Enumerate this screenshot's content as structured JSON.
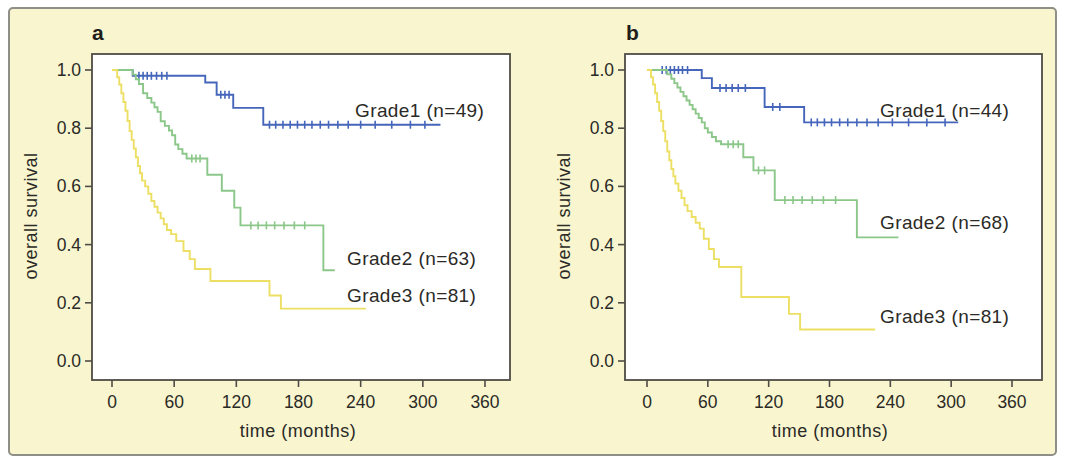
{
  "colors": {
    "grade1": "#4566ba",
    "grade2": "#8bc789",
    "grade3": "#ecdf63",
    "axis": "#4e4c46",
    "text": "#2b2a26",
    "figure_bg": "#f8f5cf",
    "figure_border": "#908f87"
  },
  "chart_data": [
    {
      "type": "line",
      "panel_label": "a",
      "xlabel": "time (months)",
      "ylabel": "overall survival",
      "xlim": [
        0,
        360
      ],
      "ylim": [
        0.0,
        1.0
      ],
      "xticks": [
        "0",
        "60",
        "120",
        "180",
        "240",
        "300",
        "360"
      ],
      "ytick_values": [
        1.0,
        0.8,
        0.6,
        0.4,
        0.2,
        0.0
      ],
      "ytick_labels": [
        "1.0",
        "0.8",
        "0.6",
        "0.4",
        "0.2",
        "0.0"
      ],
      "series": [
        {
          "name": "Grade1",
          "n": 49,
          "label": "Grade1 (n=49)",
          "color": "#4566ba",
          "drops": [
            [
              20,
              0.98
            ],
            [
              90,
              0.957
            ],
            [
              101,
              0.915
            ],
            [
              117,
              0.87
            ],
            [
              146,
              0.812
            ]
          ],
          "end": 317,
          "censors": [
            [
              26,
              0.98
            ],
            [
              30,
              0.98
            ],
            [
              34,
              0.98
            ],
            [
              38,
              0.98
            ],
            [
              43,
              0.98
            ],
            [
              48,
              0.98
            ],
            [
              53,
              0.98
            ],
            [
              105,
              0.915
            ],
            [
              109,
              0.915
            ],
            [
              113,
              0.915
            ],
            [
              152,
              0.812
            ],
            [
              158,
              0.812
            ],
            [
              165,
              0.812
            ],
            [
              172,
              0.812
            ],
            [
              179,
              0.812
            ],
            [
              186,
              0.812
            ],
            [
              193,
              0.812
            ],
            [
              201,
              0.812
            ],
            [
              209,
              0.812
            ],
            [
              218,
              0.812
            ],
            [
              228,
              0.812
            ],
            [
              240,
              0.812
            ],
            [
              254,
              0.812
            ],
            [
              270,
              0.812
            ],
            [
              288,
              0.812
            ],
            [
              302,
              0.812
            ]
          ]
        },
        {
          "name": "Grade2",
          "n": 63,
          "label": "Grade2 (n=63)",
          "color": "#8bc789",
          "drops": [
            [
              20,
              0.984
            ],
            [
              23,
              0.968
            ],
            [
              26,
              0.952
            ],
            [
              30,
              0.92
            ],
            [
              34,
              0.904
            ],
            [
              38,
              0.888
            ],
            [
              41,
              0.872
            ],
            [
              44,
              0.856
            ],
            [
              47,
              0.824
            ],
            [
              51,
              0.808
            ],
            [
              55,
              0.792
            ],
            [
              58,
              0.776
            ],
            [
              61,
              0.744
            ],
            [
              64,
              0.728
            ],
            [
              68,
              0.712
            ],
            [
              72,
              0.696
            ],
            [
              92,
              0.64
            ],
            [
              106,
              0.585
            ],
            [
              118,
              0.527
            ],
            [
              124,
              0.466
            ],
            [
              204,
              0.312
            ]
          ],
          "end": 215,
          "censors": [
            [
              77,
              0.696
            ],
            [
              81,
              0.696
            ],
            [
              85,
              0.696
            ],
            [
              134,
              0.466
            ],
            [
              141,
              0.466
            ],
            [
              149,
              0.466
            ],
            [
              157,
              0.466
            ],
            [
              166,
              0.466
            ],
            [
              176,
              0.466
            ],
            [
              186,
              0.466
            ]
          ]
        },
        {
          "name": "Grade3",
          "n": 81,
          "label": "Grade3 (n=81)",
          "color": "#ecdf63",
          "drops": [
            [
              5,
              0.975
            ],
            [
              7,
              0.95
            ],
            [
              9,
              0.92
            ],
            [
              11,
              0.89
            ],
            [
              13,
              0.86
            ],
            [
              15,
              0.825
            ],
            [
              17,
              0.79
            ],
            [
              19,
              0.76
            ],
            [
              21,
              0.73
            ],
            [
              23,
              0.7
            ],
            [
              25,
              0.67
            ],
            [
              27,
              0.645
            ],
            [
              29,
              0.62
            ],
            [
              32,
              0.6
            ],
            [
              35,
              0.575
            ],
            [
              38,
              0.55
            ],
            [
              41,
              0.53
            ],
            [
              44,
              0.51
            ],
            [
              47,
              0.49
            ],
            [
              50,
              0.47
            ],
            [
              53,
              0.45
            ],
            [
              57,
              0.436
            ],
            [
              62,
              0.412
            ],
            [
              69,
              0.378
            ],
            [
              75,
              0.35
            ],
            [
              80,
              0.316
            ],
            [
              95,
              0.275
            ],
            [
              152,
              0.225
            ],
            [
              163,
              0.18
            ]
          ],
          "end": 245,
          "censors": []
        }
      ]
    },
    {
      "type": "line",
      "panel_label": "b",
      "xlabel": "time (months)",
      "ylabel": "overall survival",
      "xlim": [
        0,
        360
      ],
      "ylim": [
        0.0,
        1.0
      ],
      "xticks": [
        "0",
        "60",
        "120",
        "180",
        "240",
        "300",
        "360"
      ],
      "ytick_values": [
        1.0,
        0.8,
        0.6,
        0.4,
        0.2,
        0.0
      ],
      "ytick_labels": [
        "1.0",
        "0.8",
        "0.6",
        "0.4",
        "0.2",
        "0.0"
      ],
      "series": [
        {
          "name": "Grade1",
          "n": 44,
          "label": "Grade1 (n=44)",
          "color": "#4566ba",
          "drops": [
            [
              54,
              0.972
            ],
            [
              64,
              0.938
            ],
            [
              116,
              0.873
            ],
            [
              155,
              0.82
            ]
          ],
          "end": 307,
          "censors": [
            [
              15,
              1.0
            ],
            [
              19,
              1.0
            ],
            [
              23,
              1.0
            ],
            [
              27,
              1.0
            ],
            [
              31,
              1.0
            ],
            [
              35,
              1.0
            ],
            [
              40,
              1.0
            ],
            [
              72,
              0.938
            ],
            [
              78,
              0.938
            ],
            [
              84,
              0.938
            ],
            [
              90,
              0.938
            ],
            [
              97,
              0.938
            ],
            [
              124,
              0.873
            ],
            [
              131,
              0.873
            ],
            [
              162,
              0.82
            ],
            [
              168,
              0.82
            ],
            [
              175,
              0.82
            ],
            [
              182,
              0.82
            ],
            [
              190,
              0.82
            ],
            [
              198,
              0.82
            ],
            [
              207,
              0.82
            ],
            [
              217,
              0.82
            ],
            [
              228,
              0.82
            ],
            [
              242,
              0.82
            ],
            [
              258,
              0.82
            ],
            [
              276,
              0.82
            ],
            [
              294,
              0.82
            ]
          ]
        },
        {
          "name": "Grade2",
          "n": 68,
          "label": "Grade2 (n=68)",
          "color": "#8bc789",
          "drops": [
            [
              20,
              0.985
            ],
            [
              24,
              0.97
            ],
            [
              27,
              0.955
            ],
            [
              30,
              0.94
            ],
            [
              33,
              0.925
            ],
            [
              36,
              0.91
            ],
            [
              39,
              0.895
            ],
            [
              42,
              0.88
            ],
            [
              45,
              0.865
            ],
            [
              48,
              0.85
            ],
            [
              51,
              0.835
            ],
            [
              54,
              0.82
            ],
            [
              57,
              0.8
            ],
            [
              60,
              0.785
            ],
            [
              64,
              0.77
            ],
            [
              68,
              0.755
            ],
            [
              73,
              0.745
            ],
            [
              95,
              0.7
            ],
            [
              105,
              0.655
            ],
            [
              126,
              0.553
            ],
            [
              207,
              0.425
            ]
          ],
          "end": 248,
          "censors": [
            [
              80,
              0.745
            ],
            [
              85,
              0.745
            ],
            [
              90,
              0.745
            ],
            [
              110,
              0.655
            ],
            [
              116,
              0.655
            ],
            [
              136,
              0.553
            ],
            [
              144,
              0.553
            ],
            [
              153,
              0.553
            ],
            [
              163,
              0.553
            ],
            [
              174,
              0.553
            ],
            [
              186,
              0.553
            ]
          ]
        },
        {
          "name": "Grade3",
          "n": 81,
          "label": "Grade3 (n=81)",
          "color": "#ecdf63",
          "drops": [
            [
              4,
              0.975
            ],
            [
              6,
              0.95
            ],
            [
              8,
              0.92
            ],
            [
              10,
              0.89
            ],
            [
              12,
              0.86
            ],
            [
              14,
              0.825
            ],
            [
              16,
              0.79
            ],
            [
              18,
              0.755
            ],
            [
              20,
              0.72
            ],
            [
              22,
              0.69
            ],
            [
              24,
              0.66
            ],
            [
              26,
              0.635
            ],
            [
              28,
              0.61
            ],
            [
              31,
              0.585
            ],
            [
              34,
              0.56
            ],
            [
              37,
              0.535
            ],
            [
              40,
              0.515
            ],
            [
              44,
              0.495
            ],
            [
              48,
              0.475
            ],
            [
              52,
              0.455
            ],
            [
              56,
              0.42
            ],
            [
              61,
              0.385
            ],
            [
              66,
              0.35
            ],
            [
              71,
              0.323
            ],
            [
              93,
              0.22
            ],
            [
              140,
              0.162
            ],
            [
              151,
              0.108
            ]
          ],
          "end": 225,
          "censors": []
        }
      ]
    }
  ]
}
